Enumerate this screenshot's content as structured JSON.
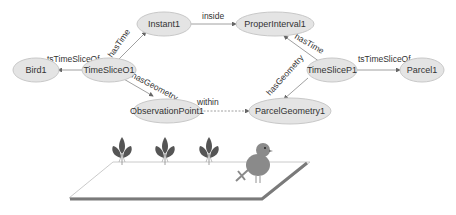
{
  "nodes": {
    "bird1": "Bird1",
    "timeslice_o1": "TimeSliceO1",
    "instant1": "Instant1",
    "proper_interval1": "ProperInterval1",
    "observation_point1": "ObservationPoint1",
    "parcel_geometry1": "ParcelGeometry1",
    "timeslice_p1": "TimeSliceP1",
    "parcel1": "Parcel1"
  },
  "edges": {
    "o1_to_bird": "tsTimeSliceOf",
    "o1_to_instant": "hasTime",
    "o1_to_obs": "hasGeometry",
    "instant_to_interval": "inside",
    "obs_to_parcelgeom": "within",
    "p1_to_interval": "hasTime",
    "p1_to_parcelgeom": "hasGeometry",
    "p1_to_parcel": "tsTimeSliceOf"
  },
  "illustration": {
    "plants": [
      "plant-icon",
      "plant-icon",
      "plant-icon"
    ],
    "animal": "bird-icon",
    "ground": "parcel-plane"
  },
  "colors": {
    "node_fill": "#e4e4e4",
    "edge": "#888888",
    "plant": "#555555",
    "bird": "#8a8a8a",
    "plane_shadow": "#7a7a7a"
  }
}
